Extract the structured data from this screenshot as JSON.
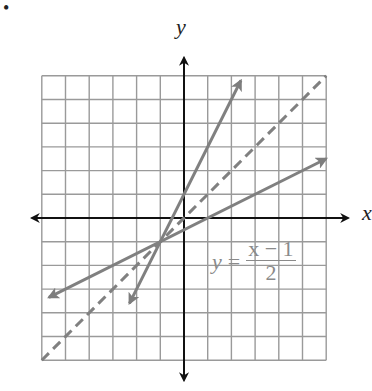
{
  "chart_data": {
    "type": "line",
    "title": "",
    "xlabel": "x",
    "ylabel": "y",
    "xlim": [
      -6,
      6
    ],
    "ylim": [
      -6,
      6
    ],
    "grid": true,
    "grid_step": 1,
    "series": [
      {
        "name": "y = 2x + 1",
        "style": "solid",
        "color": "#808080",
        "slope": 2,
        "intercept": 1,
        "x": [
          -2.3,
          2.4
        ],
        "y": [
          -3.6,
          5.8
        ]
      },
      {
        "name": "y = x",
        "style": "dashed",
        "color": "#808080",
        "slope": 1,
        "intercept": 0,
        "x": [
          -6,
          6
        ],
        "y": [
          -6,
          6
        ]
      },
      {
        "name": "y = (x - 1)/2",
        "style": "solid",
        "color": "#808080",
        "slope": 0.5,
        "intercept": -0.5,
        "x": [
          -5.7,
          6
        ],
        "y": [
          -3.35,
          2.5
        ]
      }
    ],
    "annotations": [
      {
        "text": "y = (x − 1)/2",
        "x": 2,
        "y": -2.5
      }
    ],
    "intersection": {
      "x": -1,
      "y": -1
    }
  },
  "labels": {
    "bullet": "•",
    "x_axis": "x",
    "y_axis": "y",
    "equation_lhs": "y",
    "equation_eq": "=",
    "equation_num": "x − 1",
    "equation_den": "2"
  }
}
